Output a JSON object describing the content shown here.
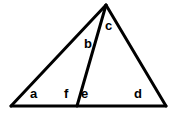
{
  "figure": {
    "kind": "geometry-diagram",
    "background_color": "#ffffff",
    "stroke_color": "#000000",
    "stroke_width": 3,
    "canvas": {
      "width": 174,
      "height": 115
    },
    "points": {
      "apex": {
        "name": "apex",
        "x": 106,
        "y": 5
      },
      "bottom_left": {
        "name": "bottom-left-vertex",
        "x": 11,
        "y": 106
      },
      "bottom_right": {
        "name": "bottom-right-vertex",
        "x": 166,
        "y": 106
      },
      "cevian_foot": {
        "name": "cevian-foot",
        "x": 77,
        "y": 106
      }
    },
    "segments": [
      {
        "name": "left-side",
        "from": "bottom_left",
        "to": "apex"
      },
      {
        "name": "right-side",
        "from": "apex",
        "to": "bottom_right"
      },
      {
        "name": "base",
        "from": "bottom_left",
        "to": "bottom_right"
      },
      {
        "name": "cevian",
        "from": "apex",
        "to": "cevian_foot"
      }
    ],
    "labels": [
      {
        "id": "a",
        "text": "a",
        "x": 30,
        "y": 87
      },
      {
        "id": "b",
        "text": "b",
        "x": 84,
        "y": 37
      },
      {
        "id": "c",
        "text": "c",
        "x": 105,
        "y": 19
      },
      {
        "id": "d",
        "text": "d",
        "x": 134,
        "y": 87
      },
      {
        "id": "e",
        "text": "e",
        "x": 81,
        "y": 87
      },
      {
        "id": "f",
        "text": "f",
        "x": 64,
        "y": 87
      }
    ]
  }
}
